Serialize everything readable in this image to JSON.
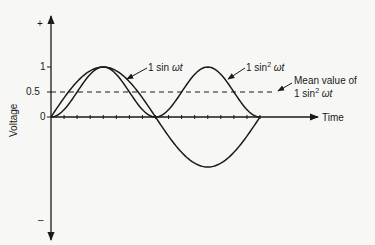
{
  "chart_data": {
    "type": "line",
    "title": "",
    "xlabel": "Time",
    "ylabel": "Voltage",
    "y_axis_ends": {
      "top": "+",
      "bottom": "–"
    },
    "yticks": [
      "1",
      "0.5",
      "0"
    ],
    "ylim": [
      -1,
      1
    ],
    "x_range_cycles": 1,
    "grid": false,
    "x_tick_count": 16,
    "series": [
      {
        "name": "1 sin ωt",
        "function": "sin",
        "period": 1,
        "amplitude": 1,
        "x": [
          0,
          0.25,
          0.5,
          0.75,
          1.0
        ],
        "values": [
          0,
          1,
          0,
          -1,
          0
        ]
      },
      {
        "name": "1 sin² ωt",
        "function": "sin^2",
        "period": 1,
        "amplitude": 1,
        "x": [
          0,
          0.25,
          0.5,
          0.75,
          1.0
        ],
        "values": [
          0,
          1,
          0,
          1,
          0
        ]
      },
      {
        "name": "Mean value of 1 sin² ωt",
        "style": "dashed",
        "values": [
          0.5,
          0.5
        ]
      }
    ],
    "annotations": [
      {
        "text": "1 sin ωt",
        "points_to": "sine curve"
      },
      {
        "text": "1 sin² ωt",
        "points_to": "sin squared curve"
      },
      {
        "text": "Mean value of 1 sin² ωt",
        "points_to": "dashed line at 0.5"
      }
    ]
  },
  "labels": {
    "plus": "+",
    "minus": "–",
    "y1": "1",
    "y05": "0.5",
    "y0": "0",
    "ylabel": "Voltage",
    "xlabel": "Time",
    "sin_prefix": "1 sin ",
    "sin_var": "ωt",
    "sin2_prefix": "1 sin",
    "sup2": "2",
    "sin2_var": " ωt",
    "mean_line1": "Mean value of",
    "mean_line2_prefix": "1 sin",
    "mean_line2_var": " ωt"
  },
  "geometry": {
    "origin_x": 51,
    "zero_y": 117,
    "unit_px": 50,
    "cycle_px": 209,
    "axis_end_x": 318
  }
}
